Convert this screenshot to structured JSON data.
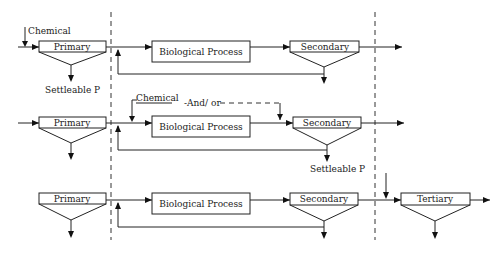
{
  "diagram": {
    "row1": {
      "chemical_label": "Chemical",
      "primary_label": "Primary",
      "bio_label": "Biological Process",
      "secondary_label": "Secondary",
      "settleable_label": "Settleable P"
    },
    "row2": {
      "chemical_label": "Chemical",
      "andor_label": "-And/ or",
      "primary_label": "Primary",
      "bio_label": "Biological Process",
      "secondary_label": "Secondary",
      "settleable_label": "Settleable P"
    },
    "row3": {
      "primary_label": "Primary",
      "bio_label": "Biological Process",
      "secondary_label": "Secondary",
      "tertiary_label": "Tertiary"
    }
  }
}
